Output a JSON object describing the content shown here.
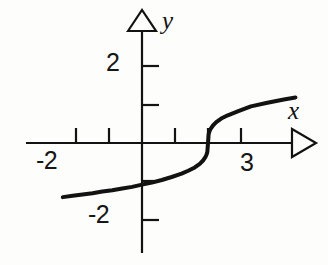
{
  "figure": {
    "kind": "cartesian-graph",
    "background_color": "#fdfdfc",
    "ink_color": "#121212",
    "width": 328,
    "height": 265
  },
  "axes": {
    "x_axis_label": "x",
    "y_axis_label": "y",
    "x_arrowhead": "open-triangle-right",
    "y_arrowhead": "open-triangle-up",
    "origin_px": {
      "x": 142,
      "y": 143
    },
    "unit_px": 33,
    "x_ticks": [
      {
        "value": -2,
        "label": "-2",
        "px": 76
      },
      {
        "value": -1,
        "label": "",
        "px": 109
      },
      {
        "value": 1,
        "label": "",
        "px": 175
      },
      {
        "value": 2,
        "label": "",
        "px": 208
      },
      {
        "value": 3,
        "label": "3",
        "px": 241
      }
    ],
    "y_ticks": [
      {
        "value": 2,
        "label": "2",
        "px": 66
      },
      {
        "value": 1,
        "label": "",
        "px": 105
      },
      {
        "value": -1,
        "label": "",
        "px": 181
      },
      {
        "value": -2,
        "label": "-2",
        "px": 220
      }
    ],
    "x_tick_labels_shown": [
      "-2",
      "3"
    ],
    "y_tick_labels_shown": [
      "2",
      "-2"
    ]
  },
  "chart_data": {
    "type": "line",
    "title": "",
    "xlabel": "x",
    "ylabel": "y",
    "grid": false,
    "legend": false,
    "xlim": [
      -2.4,
      4.7
    ],
    "ylim": [
      -2.8,
      2.6
    ],
    "curve_equation": "y = cbrt(x - 2)",
    "series": [
      {
        "name": "y = cbrt(x - 2)",
        "color": "#121212",
        "linewidth": 4,
        "x": [
          -2.4,
          -2.1,
          -1.8,
          -1.5,
          -1.2,
          -0.9,
          -0.6,
          -0.3,
          0.0,
          0.3,
          0.6,
          0.9,
          1.2,
          1.4,
          1.6,
          1.75,
          1.85,
          1.92,
          1.96,
          1.98,
          2.0,
          2.02,
          2.04,
          2.08,
          2.15,
          2.25,
          2.4,
          2.6,
          2.9,
          3.3,
          3.8,
          4.3,
          4.65
        ],
        "y": [
          -1.64,
          -1.6,
          -1.56,
          -1.52,
          -1.47,
          -1.43,
          -1.38,
          -1.33,
          -1.26,
          -1.2,
          -1.12,
          -1.03,
          -0.93,
          -0.84,
          -0.74,
          -0.63,
          -0.53,
          -0.43,
          -0.34,
          -0.27,
          0.0,
          0.27,
          0.34,
          0.43,
          0.53,
          0.63,
          0.74,
          0.84,
          0.96,
          1.11,
          1.22,
          1.32,
          1.38
        ]
      }
    ],
    "annotations": [
      {
        "text": "x",
        "role": "x-axis-name"
      },
      {
        "text": "y",
        "role": "y-axis-name"
      },
      {
        "text": "2",
        "role": "y-tick-label"
      },
      {
        "text": "-2",
        "role": "y-tick-label"
      },
      {
        "text": "-2",
        "role": "x-tick-label"
      },
      {
        "text": "3",
        "role": "x-tick-label"
      }
    ]
  }
}
